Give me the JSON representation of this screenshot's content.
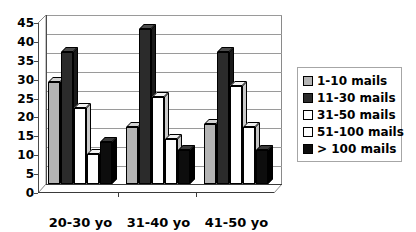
{
  "chart_data": {
    "type": "bar",
    "title": "",
    "subtitle": "",
    "xlabel": "",
    "ylabel": "",
    "categories": [
      "20-30 yo",
      "31-40 yo",
      "41-50 yo"
    ],
    "series": [
      {
        "name": "1-10 mails",
        "color": "#b4b4b4",
        "values": [
          27,
          15,
          16
        ]
      },
      {
        "name": "11-30 mails",
        "color": "#2b2b2b",
        "values": [
          35,
          41,
          35
        ]
      },
      {
        "name": "31-50 mails",
        "color": "#ffffff",
        "values": [
          20,
          23,
          26
        ]
      },
      {
        "name": "51-100 mails",
        "color": "#fdfdfd",
        "values": [
          8,
          12,
          15
        ]
      },
      {
        "name": "> 100 mails",
        "color": "#0d0d0d",
        "values": [
          11,
          9,
          9
        ]
      }
    ],
    "ylim": [
      0,
      45
    ],
    "yticks": [
      0,
      5,
      10,
      15,
      20,
      25,
      30,
      35,
      40,
      45
    ],
    "ytick_labels": [
      "0",
      "5",
      "10",
      "15",
      "20",
      "25",
      "30",
      "35",
      "40",
      "45"
    ],
    "grid": true,
    "grid_axis": "y",
    "legend_position": "right",
    "style": "3d-column-grayscale",
    "background": "#ffffff"
  }
}
